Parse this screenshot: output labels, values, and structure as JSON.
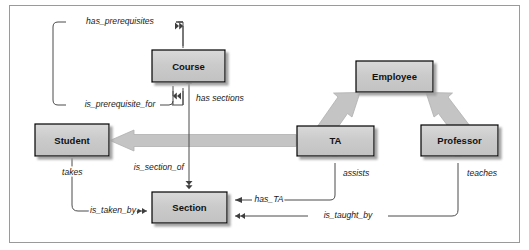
{
  "diagram": {
    "type": "uml-class-diagram",
    "colors": {
      "box_fill": "#c9c9c9",
      "box_fill_top": "#d8d8d8",
      "box_border": "#000000",
      "box_shadow": "#a0a0a0",
      "thin_line": "#4a4a4a",
      "thick_arrow": "#bdbdbd",
      "thick_arrow_edge": "#a6a6a6",
      "frame_border": "#9a9a9a",
      "background": "#ffffff",
      "text": "#111111"
    },
    "entities": [
      {
        "id": "course",
        "label": "Course",
        "x": 152,
        "y": 50,
        "w": 73,
        "h": 32
      },
      {
        "id": "employee",
        "label": "Employee",
        "x": 356,
        "y": 61,
        "w": 77,
        "h": 31
      },
      {
        "id": "student",
        "label": "Student",
        "x": 35,
        "y": 124,
        "w": 74,
        "h": 32
      },
      {
        "id": "ta",
        "label": "TA",
        "x": 297,
        "y": 126,
        "w": 77,
        "h": 30
      },
      {
        "id": "professor",
        "label": "Professor",
        "x": 421,
        "y": 125,
        "w": 77,
        "h": 31
      },
      {
        "id": "section",
        "label": "Section",
        "x": 152,
        "y": 192,
        "w": 75,
        "h": 31
      }
    ],
    "relationships": [
      {
        "id": "has-prerequisites",
        "label": "has_prerequisites",
        "from": "course",
        "to": "course",
        "label_x": 120,
        "label_y": 22,
        "anchor": "mid"
      },
      {
        "id": "is-prerequisite-for",
        "label": "is_prerequisite_for",
        "from": "course",
        "to": "course",
        "label_x": 120,
        "label_y": 105,
        "anchor": "mid"
      },
      {
        "id": "has-sections",
        "label": "has sections",
        "from": "course",
        "to": "section",
        "label_x": 196,
        "label_y": 99,
        "anchor": "start"
      },
      {
        "id": "is-section-of",
        "label": "is_section_of",
        "from": "section",
        "to": "course",
        "label_x": 184,
        "label_y": 168,
        "anchor": "end"
      },
      {
        "id": "takes",
        "label": "takes",
        "from": "student",
        "to": "section",
        "label_x": 62,
        "label_y": 173,
        "anchor": "start"
      },
      {
        "id": "is-taken-by",
        "label": "is_taken_by",
        "from": "section",
        "to": "student",
        "label_x": 113,
        "label_y": 211,
        "anchor": "mid"
      },
      {
        "id": "has-ta",
        "label": "has_TA",
        "from": "section",
        "to": "ta",
        "label_x": 269,
        "label_y": 200,
        "anchor": "mid"
      },
      {
        "id": "assists",
        "label": "assists",
        "from": "ta",
        "to": "section",
        "label_x": 343,
        "label_y": 174,
        "anchor": "start"
      },
      {
        "id": "is-taught-by",
        "label": "is_taught_by",
        "from": "section",
        "to": "professor",
        "label_x": 348,
        "label_y": 216,
        "anchor": "mid"
      },
      {
        "id": "teaches",
        "label": "teaches",
        "from": "professor",
        "to": "section",
        "label_x": 467,
        "label_y": 174,
        "anchor": "start"
      }
    ],
    "generalizations": [
      {
        "id": "ta-is-employee",
        "from": "ta",
        "to": "employee"
      },
      {
        "id": "professor-is-employee",
        "from": "professor",
        "to": "employee"
      },
      {
        "id": "ta-is-student",
        "from": "ta",
        "to": "student"
      }
    ]
  }
}
